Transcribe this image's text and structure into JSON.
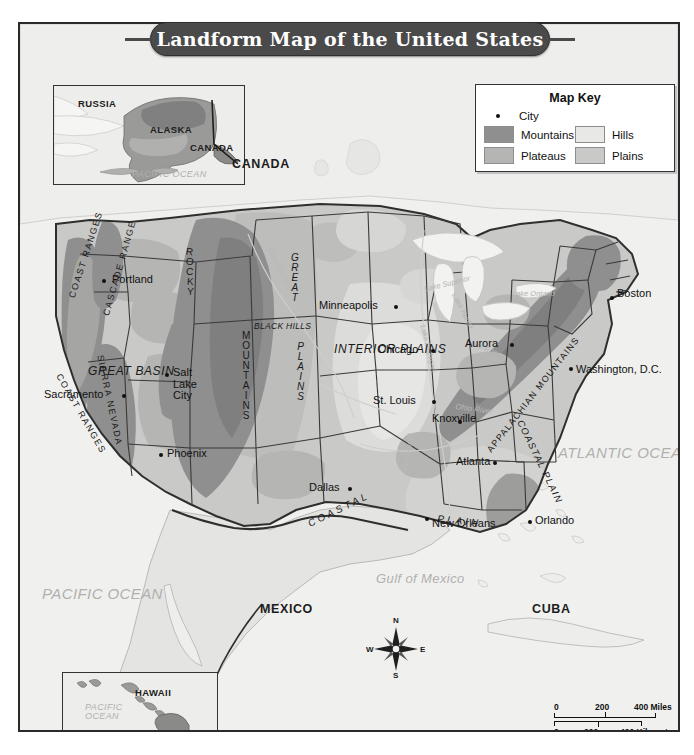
{
  "title": "Landform Map of the United States",
  "map_key": {
    "heading": "Map Key",
    "city_label": "City",
    "entries": [
      {
        "label": "Mountains",
        "color": "#8f8f8f"
      },
      {
        "label": "Hills",
        "color": "#e8e8e6"
      },
      {
        "label": "Plateaus",
        "color": "#b5b5b3"
      },
      {
        "label": "Plains",
        "color": "#c9c9c7"
      }
    ]
  },
  "insets": {
    "alaska": {
      "labels": [
        "RUSSIA",
        "ALASKA",
        "CANADA"
      ],
      "ocean": "PACIFIC OCEAN"
    },
    "hawaii": {
      "label": "HAWAII",
      "ocean": "PACIFIC OCEAN"
    }
  },
  "countries": [
    "CANADA",
    "MEXICO",
    "CUBA"
  ],
  "oceans": [
    {
      "name": "PACIFIC\nOCEAN"
    },
    {
      "name": "ATLANTIC\nOCEAN"
    },
    {
      "name": "Gulf of Mexico"
    }
  ],
  "ocean_pacific_l1": "PACIFIC",
  "ocean_pacific_l2": "OCEAN",
  "ocean_atlantic_l1": "ATLANTIC",
  "ocean_atlantic_l2": "OCEAN",
  "gulf_of_mexico": "Gulf of Mexico",
  "canada": "CANADA",
  "mexico": "MEXICO",
  "cuba": "CUBA",
  "lakes": {
    "superior": "Lake Superior",
    "michigan": "Lake Michigan",
    "huron": "Lake Huron",
    "erie": "Lake Erie",
    "ontario_l1": "Lake",
    "ontario_l2": "Ontario"
  },
  "rivers": {
    "missouri": "Missouri River",
    "mississippi": "Mississippi",
    "ohio": "Ohio River"
  },
  "landforms": {
    "great_basin_l1": "GREAT",
    "great_basin_l2": "BASIN",
    "black_hills_l1": "BLACK",
    "black_hills_l2": "HILLS",
    "interior_plains_l1": "INTERIOR",
    "interior_plains_l2": "PLAINS",
    "coast_ranges_n": "COAST RANGES",
    "coast_ranges_s": "COAST RANGES",
    "cascade_range": "CASCADE RANGE",
    "sierra_nevada": "SIERRA NEVADA",
    "rocky_mountains_r": "ROCK",
    "rocky_mountains_m": "MOUNTAIN",
    "great_plains_g": "GREAT",
    "great_plains_p": "PLAINS",
    "appalachian": "APPALACHIAN MOUNTAINS",
    "coastal_plain_e": "COASTAL PLAIN",
    "coastal_plain_s": "COASTAL",
    "coastal_plain_s2": "PLAIN"
  },
  "cities": [
    {
      "name": "Portland",
      "x": 82,
      "y": 255,
      "dx": 10,
      "dy": -6
    },
    {
      "name": "Sacramento",
      "x": 102,
      "y": 370,
      "dx": -78,
      "dy": -6
    },
    {
      "name": "Salt Lake\nCity",
      "x": 148,
      "y": 350,
      "dx": 7,
      "dy": -6
    },
    {
      "name": "Phoenix",
      "x": 158,
      "y": 451,
      "dx": 8,
      "dy": -6
    },
    {
      "name": "Minneapolis",
      "x": 374,
      "y": 303,
      "dx": -58,
      "dy": -6
    },
    {
      "name": "Chicago",
      "x": 412,
      "y": 345,
      "dx": -44,
      "dy": -6
    },
    {
      "name": "St. Louis",
      "x": 410,
      "y": 394,
      "dx": -48,
      "dy": -6
    },
    {
      "name": "Dallas",
      "x": 344,
      "y": 481,
      "dx": -38,
      "dy": -6
    },
    {
      "name": "New Orleans",
      "x": 424,
      "y": 511,
      "dx": 6,
      "dy": -6
    },
    {
      "name": "Aurora",
      "x": 490,
      "y": 341,
      "dx": -42,
      "dy": -6
    },
    {
      "name": "Knoxville",
      "x": 447,
      "y": 413,
      "dx": 6,
      "dy": -6
    },
    {
      "name": "Atlanta",
      "x": 488,
      "y": 455,
      "dx": -40,
      "dy": -6
    },
    {
      "name": "Orlando",
      "x": 529,
      "y": 516,
      "dx": 6,
      "dy": -6
    },
    {
      "name": "Washington, D.C.",
      "x": 556,
      "y": 364,
      "dx": 6,
      "dy": -6
    },
    {
      "name": "Boston",
      "x": 601,
      "y": 293,
      "dx": 6,
      "dy": -6
    }
  ],
  "city_labels": {
    "portland": "Portland",
    "sacramento": "Sacramento",
    "salt_lake_city_l1": "Salt",
    "salt_lake_city_l2": "Lake",
    "salt_lake_city_l3": "City",
    "phoenix": "Phoenix",
    "minneapolis": "Minneapolis",
    "chicago": "Chicago",
    "st_louis": "St. Louis",
    "dallas": "Dallas",
    "new_orleans": "New Orleans",
    "aurora": "Aurora",
    "knoxville": "Knoxville",
    "atlanta": "Atlanta",
    "orlando": "Orlando",
    "washington_dc": "Washington, D.C.",
    "boston": "Boston"
  },
  "compass": {
    "n": "N",
    "e": "E",
    "s": "S",
    "w": "W"
  },
  "scale": {
    "miles": {
      "zero": "0",
      "mid": "200",
      "end": "400 Miles"
    },
    "kilometers": {
      "zero": "0",
      "mid": "200",
      "end": "400 Kilometers"
    }
  }
}
